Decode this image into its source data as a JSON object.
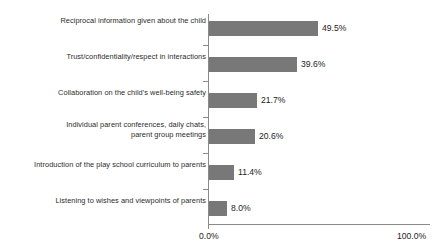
{
  "chart_data": {
    "type": "bar",
    "orientation": "horizontal",
    "title": "",
    "subtitle": "",
    "xlabel": "",
    "ylabel": "",
    "xlim": [
      0,
      100
    ],
    "grid": false,
    "legend": null,
    "bar_color": "#787878",
    "axis_color": "#8a8a8a",
    "text_color": "#1d1d1d",
    "categories": [
      "Reciprocal information given about the child",
      "Trust/confidentiality/respect in interactions",
      "Collaboration on the child's well-being safety",
      "Individual parent conferences, daily chats,\nparent group meetings",
      "Introduction of the play school curriculum to parents",
      "Listening to wishes and viewpoints of parents"
    ],
    "values": [
      49.5,
      39.6,
      21.7,
      20.6,
      11.4,
      8.0
    ],
    "value_labels": [
      "49.5%",
      "39.6%",
      "21.7%",
      "20.6%",
      "11.4%",
      "8.0%"
    ],
    "x_tick_labels": [
      "0.0%",
      "100.0%"
    ],
    "x_ticks": [
      0,
      100
    ]
  }
}
